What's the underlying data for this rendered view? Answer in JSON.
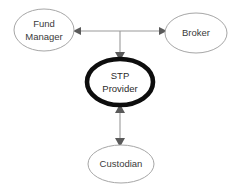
{
  "diagram": {
    "background_color": "#ffffff",
    "nodes": [
      {
        "id": "fund-manager",
        "label_line1": "Fund",
        "label_line2": "Manager",
        "shape": "ellipse",
        "emphasis": "normal",
        "border_color": "#a6a6a6",
        "text_color": "#3a3a3a",
        "cx": 44,
        "cy": 30,
        "rx": 30,
        "ry": 21
      },
      {
        "id": "broker",
        "label_line1": "Broker",
        "label_line2": "",
        "shape": "ellipse",
        "emphasis": "normal",
        "border_color": "#a6a6a6",
        "text_color": "#3a3a3a",
        "cx": 196,
        "cy": 33,
        "rx": 31,
        "ry": 20
      },
      {
        "id": "stp-provider",
        "label_line1": "STP",
        "label_line2": "Provider",
        "shape": "ellipse",
        "emphasis": "bold",
        "border_color": "#0d0d0d",
        "text_color": "#2b2b2b",
        "cx": 120,
        "cy": 82,
        "rx": 33,
        "ry": 23
      },
      {
        "id": "custodian",
        "label_line1": "Custodian",
        "label_line2": "",
        "shape": "ellipse",
        "emphasis": "normal",
        "border_color": "#a6a6a6",
        "text_color": "#3a3a3a",
        "cx": 121,
        "cy": 164,
        "rx": 33,
        "ry": 19
      }
    ],
    "connections": [
      {
        "id": "fund-manager-broker",
        "from": "fund-manager",
        "to": "broker",
        "orientation": "horizontal",
        "arrow_type": "double",
        "line_color": "#9a9a9a"
      },
      {
        "id": "hub-feed-to-stp",
        "from": "fund-manager-broker",
        "to": "stp-provider",
        "orientation": "vertical",
        "arrow_type": "single-down",
        "line_color": "#9a9a9a"
      },
      {
        "id": "stp-custodian",
        "from": "stp-provider",
        "to": "custodian",
        "orientation": "vertical",
        "arrow_type": "double",
        "line_color": "#9a9a9a"
      }
    ]
  }
}
